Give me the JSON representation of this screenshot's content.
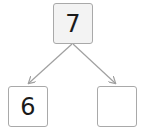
{
  "diagram": {
    "type": "number-bond",
    "whole": {
      "value": "7"
    },
    "parts": [
      {
        "value": "6"
      },
      {
        "value": ""
      }
    ],
    "colors": {
      "box_border": "#a9a9a9",
      "whole_fill": "#f3f3f3",
      "part_fill": "#ffffff",
      "arrow": "#a0a0a0",
      "text": "#1a1a1a"
    }
  }
}
